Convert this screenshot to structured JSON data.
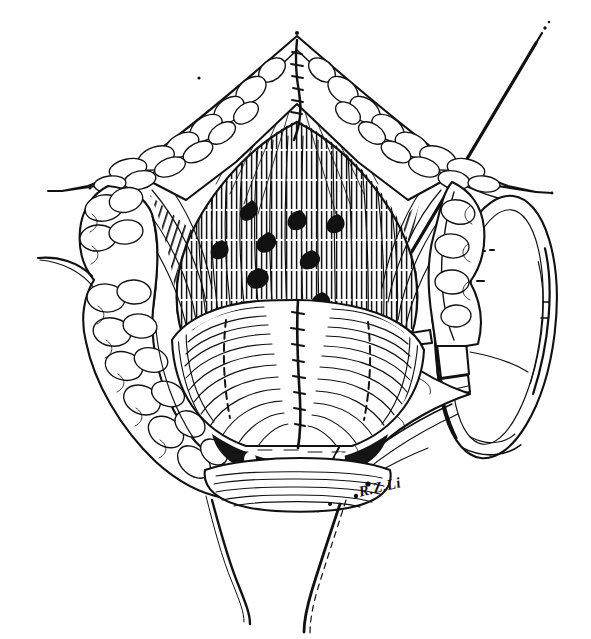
{
  "figure": {
    "medium": "pen-and-ink line drawing",
    "background_color": "#ffffff",
    "ink_color": "#111111",
    "width": 591,
    "height": 639,
    "signature": "R.Z.Li",
    "signature_position": {
      "x": 357,
      "y": 484,
      "rotation_deg": -13
    },
    "labels": [],
    "annotations": [],
    "callout_text": ""
  },
  "regions": [
    {
      "id": "upper-skin-flap",
      "name": "upper retracted skin and subcutaneous fat flap",
      "description": "Inverted V-shaped flap apex at top center, lobulated adipose texture along its outer margin",
      "apex": {
        "x": 297,
        "y": 36
      }
    },
    {
      "id": "left-fat-flap",
      "name": "left retracted fatty tissue flap",
      "description": "Lobulated subcutaneous fat retracted to the left side of the operative field"
    },
    {
      "id": "right-fat-flap",
      "name": "right retracted fatty tissue flap",
      "description": "Lobulated subcutaneous fat retracted to the right side, engaged by ring retractor hook"
    },
    {
      "id": "deep-muscle-field",
      "name": "deep muscular operative field",
      "description": "Densely hatched vertical striated muscle/fascial fibers within the wound depths"
    },
    {
      "id": "bladder-neck",
      "name": "bladder neck and bladder dome",
      "description": "Rounded smooth midline structure with fine contour hatching and a central midline seam"
    },
    {
      "id": "anastomosis",
      "name": "vesicourethral anastomosis",
      "description": "Dark shadowed junction beneath the bladder neck with interrupted suture bites"
    },
    {
      "id": "urethral-stump",
      "name": "urethral stump / catheter",
      "description": "Horizontally hatched tubular structure at the lower midline"
    },
    {
      "id": "lower-outline",
      "name": "lower body contour",
      "description": "Two converging curved lines descending to the bottom edge of the plate"
    }
  ],
  "instruments": [
    {
      "id": "ring-retractor",
      "name": "ring retractor",
      "description": "Large oval self-retaining ring retractor occupying the right margin of the field",
      "center": {
        "x": 495,
        "y": 325
      }
    },
    {
      "id": "retractor-clamp",
      "name": "retractor clamp / stay hook",
      "description": "Clamp block fixed to the ring, carrying a hook engaging the right tissue flap",
      "position": {
        "x": 452,
        "y": 330
      }
    },
    {
      "id": "suture-thread",
      "name": "suture thread",
      "description": "Long tapered suture running from the anastomosis diagonally up and to the right, off the top-right corner",
      "from": {
        "x": 400,
        "y": 275
      },
      "to": {
        "x": 536,
        "y": 40
      }
    }
  ]
}
